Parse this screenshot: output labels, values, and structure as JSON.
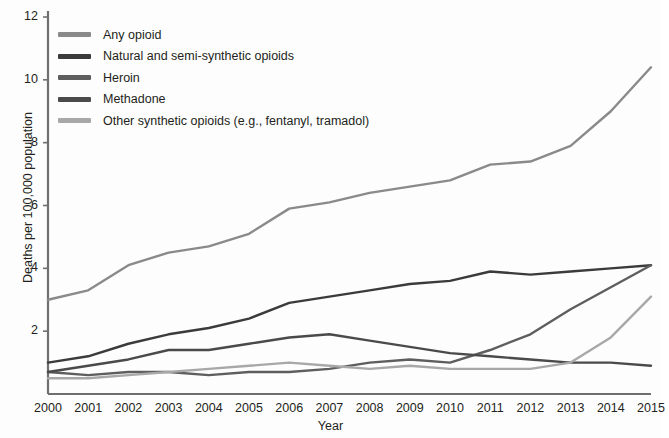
{
  "chart_data": {
    "type": "line",
    "title": "",
    "xlabel": "Year",
    "ylabel": "Deaths per 100,000 population",
    "categories": [
      2000,
      2001,
      2002,
      2003,
      2004,
      2005,
      2006,
      2007,
      2008,
      2009,
      2010,
      2011,
      2012,
      2013,
      2014,
      2015
    ],
    "xlim": [
      2000,
      2015
    ],
    "ylim": [
      0,
      12
    ],
    "yticks": [
      0,
      2,
      4,
      6,
      8,
      10,
      12
    ],
    "ytick_labels": [
      "",
      "2",
      "4",
      "6",
      "8",
      "10",
      "12"
    ],
    "xticks": [
      "2000",
      "2001",
      "2002",
      "2003",
      "2004",
      "2005",
      "2006",
      "2007",
      "2008",
      "2009",
      "2010",
      "2011",
      "2012",
      "2013",
      "2014",
      "2015"
    ],
    "grid": false,
    "legend_position": "upper-left",
    "series": [
      {
        "name": "Any opioid",
        "color": "#8a8a8a",
        "values": [
          3.0,
          3.3,
          4.1,
          4.5,
          4.7,
          5.1,
          5.9,
          6.1,
          6.4,
          6.6,
          6.8,
          7.3,
          7.4,
          7.9,
          9.0,
          10.4
        ]
      },
      {
        "name": "Natural and semi-synthetic opioids",
        "color": "#3b3b3b",
        "values": [
          1.0,
          1.2,
          1.6,
          1.9,
          2.1,
          2.4,
          2.9,
          3.1,
          3.3,
          3.5,
          3.6,
          3.9,
          3.8,
          3.9,
          4.0,
          4.1
        ]
      },
      {
        "name": "Heroin",
        "color": "#5e5e5e",
        "values": [
          0.7,
          0.6,
          0.7,
          0.7,
          0.6,
          0.7,
          0.7,
          0.8,
          1.0,
          1.1,
          1.0,
          1.4,
          1.9,
          2.7,
          3.4,
          4.1
        ]
      },
      {
        "name": "Methadone",
        "color": "#4a4a4a",
        "values": [
          0.7,
          0.9,
          1.1,
          1.4,
          1.4,
          1.6,
          1.8,
          1.9,
          1.7,
          1.5,
          1.3,
          1.2,
          1.1,
          1.0,
          1.0,
          0.9
        ]
      },
      {
        "name": "Other synthetic opioids (e.g., fentanyl, tramadol)",
        "color": "#a8a8a8",
        "values": [
          0.5,
          0.5,
          0.6,
          0.7,
          0.8,
          0.9,
          1.0,
          0.9,
          0.8,
          0.9,
          0.8,
          0.8,
          0.8,
          1.0,
          1.8,
          3.1
        ]
      }
    ]
  },
  "axes": {
    "y_title": "Deaths per 100,000 population",
    "x_title": "Year"
  },
  "legend": {
    "items": [
      {
        "label": "Any opioid",
        "color": "#8a8a8a"
      },
      {
        "label": "Natural and semi-synthetic opioids",
        "color": "#3b3b3b"
      },
      {
        "label": "Heroin",
        "color": "#5e5e5e"
      },
      {
        "label": "Methadone",
        "color": "#4a4a4a"
      },
      {
        "label": "Other synthetic opioids (e.g., fentanyl, tramadol)",
        "color": "#a8a8a8"
      }
    ]
  },
  "style": {
    "axis_color": "#6f6f6f",
    "text_color": "#231f20",
    "background": "#fdfdfd"
  }
}
